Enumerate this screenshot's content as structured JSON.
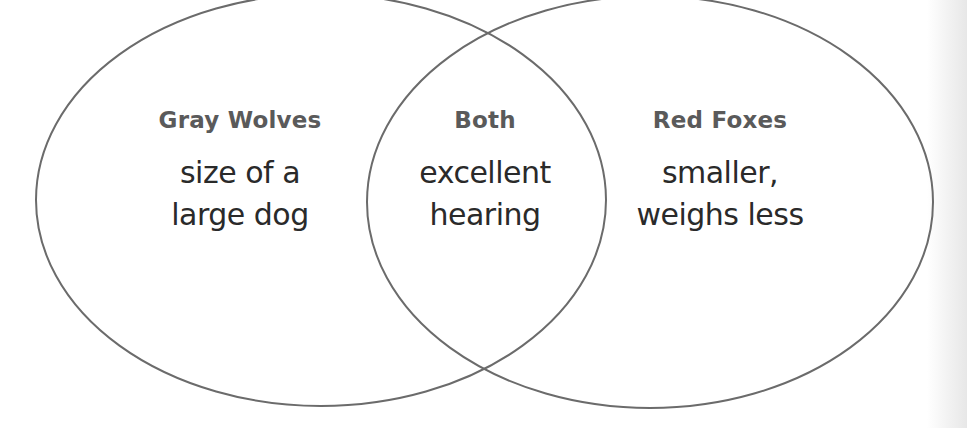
{
  "diagram": {
    "type": "venn",
    "stroke_color": "#6b6b6b",
    "circles": [
      {
        "id": "left",
        "cx": 321,
        "cy": 200,
        "rx": 285,
        "ry": 206
      },
      {
        "id": "right",
        "cx": 650,
        "cy": 202,
        "rx": 283,
        "ry": 206
      }
    ],
    "regions": {
      "left": {
        "heading": "Gray Wolves",
        "lines": [
          "size of a",
          "large dog"
        ]
      },
      "both": {
        "heading": "Both",
        "lines": [
          "excellent",
          "hearing"
        ]
      },
      "right": {
        "heading": "Red Foxes",
        "lines": [
          "smaller,",
          "weighs less"
        ]
      }
    }
  }
}
